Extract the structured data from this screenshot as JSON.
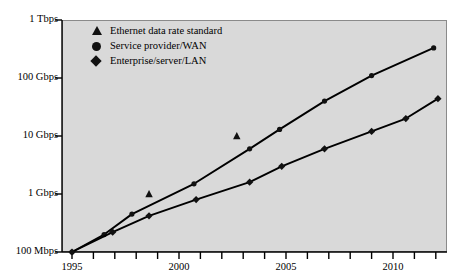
{
  "chart_data": {
    "type": "line",
    "title": "",
    "xlabel": "",
    "ylabel": "",
    "xlim": [
      1994.5,
      2012.5
    ],
    "ylim_log_bps": [
      100000000,
      1000000000000
    ],
    "y_scale": "log",
    "grid": false,
    "legend_position": "top-left-inside",
    "y_ticks": [
      {
        "label": "1 Tbps",
        "value_bps": 1000000000000
      },
      {
        "label": "100 Gbps",
        "value_bps": 100000000000
      },
      {
        "label": "10 Gbps",
        "value_bps": 10000000000
      },
      {
        "label": "1 Gbps",
        "value_bps": 1000000000
      },
      {
        "label": "100 Mbps",
        "value_bps": 100000000
      }
    ],
    "x_ticks_labeled": [
      "1995",
      "2000",
      "2005",
      "2010"
    ],
    "x_ticks_all": [
      1995,
      1996,
      1997,
      1998,
      1999,
      2000,
      2001,
      2002,
      2003,
      2004,
      2005,
      2006,
      2007,
      2008,
      2009,
      2010,
      2011,
      2012
    ],
    "series": [
      {
        "name": "Service provider/WAN",
        "marker": "circle",
        "points": [
          {
            "x": 1995.0,
            "y_bps": 100000000
          },
          {
            "x": 1996.5,
            "y_bps": 200000000
          },
          {
            "x": 1997.8,
            "y_bps": 450000000
          },
          {
            "x": 2000.7,
            "y_bps": 1500000000
          },
          {
            "x": 2003.3,
            "y_bps": 6000000000
          },
          {
            "x": 2004.7,
            "y_bps": 13000000000
          },
          {
            "x": 2006.8,
            "y_bps": 40000000000
          },
          {
            "x": 2009.0,
            "y_bps": 110000000000
          },
          {
            "x": 2011.9,
            "y_bps": 330000000000
          }
        ]
      },
      {
        "name": "Enterprise/server/LAN",
        "marker": "diamond",
        "points": [
          {
            "x": 1995.0,
            "y_bps": 100000000
          },
          {
            "x": 1996.9,
            "y_bps": 220000000
          },
          {
            "x": 1998.6,
            "y_bps": 420000000
          },
          {
            "x": 2000.8,
            "y_bps": 800000000
          },
          {
            "x": 2003.3,
            "y_bps": 1600000000
          },
          {
            "x": 2004.8,
            "y_bps": 3000000000
          },
          {
            "x": 2006.8,
            "y_bps": 6000000000
          },
          {
            "x": 2009.0,
            "y_bps": 12000000000
          },
          {
            "x": 2010.6,
            "y_bps": 20000000000
          },
          {
            "x": 2012.1,
            "y_bps": 44000000000
          }
        ]
      },
      {
        "name": "Ethernet data rate standard",
        "marker": "triangle",
        "points": [
          {
            "x": 1998.6,
            "y_bps": 1000000000
          },
          {
            "x": 2002.7,
            "y_bps": 10000000000
          }
        ]
      }
    ],
    "legend": [
      {
        "marker": "triangle",
        "label": "Ethernet data rate standard"
      },
      {
        "marker": "circle",
        "label": "Service provider/WAN"
      },
      {
        "marker": "diamond",
        "label": "Enterprise/server/LAN"
      }
    ],
    "colors": {
      "plot_background": "#d9d9d9",
      "page_background": "#ffffff",
      "marker": "#111111",
      "line": "#000000",
      "axis": "#000000",
      "frame": "#8a8a8a"
    }
  }
}
